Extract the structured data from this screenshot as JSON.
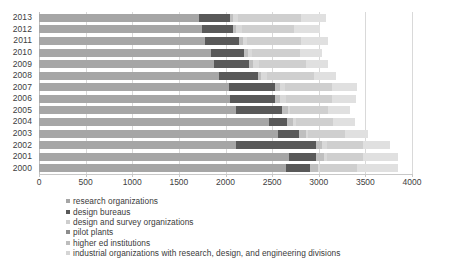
{
  "chart_data": {
    "type": "bar",
    "orientation": "horizontal",
    "stacked": true,
    "title": "",
    "xlabel": "",
    "ylabel": "",
    "xlim": [
      0,
      4000
    ],
    "xticks": [
      0,
      500,
      1000,
      1500,
      2000,
      2500,
      3000,
      3500,
      4000
    ],
    "grid": true,
    "legend_position": "bottom-left",
    "categories": [
      "2013",
      "2012",
      "2011",
      "2010",
      "2009",
      "2008",
      "2007",
      "2006",
      "2005",
      "2004",
      "2003",
      "2002",
      "2001",
      "2000"
    ],
    "series": [
      {
        "name": "research organizations",
        "color": "#a6a6a6",
        "values": [
          1719,
          1744,
          1782,
          1840,
          1878,
          1926,
          2036,
          2049,
          2115,
          2464,
          2564,
          2110,
          2677,
          2646
        ]
      },
      {
        "name": "design bureaus",
        "color": "#595959",
        "values": [
          331,
          338,
          364,
          362,
          377,
          418,
          497,
          482,
          489,
          194,
          228,
          865,
          289,
          257
        ]
      },
      {
        "name": "design and survey organizations",
        "color": "#bfbfbf",
        "values": [
          33,
          33,
          38,
          36,
          42,
          42,
          49,
          58,
          61,
          63,
          68,
          57,
          85,
          85
        ]
      },
      {
        "name": "pilot plants",
        "color": "#d9d9d9",
        "values": [
          53,
          60,
          49,
          47,
          57,
          58,
          60,
          58,
          30,
          31,
          28,
          55,
          33,
          30
        ]
      },
      {
        "name": "higher ed institutions",
        "color": "#cfcfcf",
        "values": [
          671,
          560,
          581,
          517,
          506,
          503,
          500,
          500,
          406,
          402,
          393,
          390,
          388,
          390
        ]
      },
      {
        "name": "industrial organizations with research, design, and engineering divisions",
        "color": "#e0e0e0",
        "values": [
          266,
          280,
          280,
          238,
          239,
          239,
          265,
          255,
          231,
          238,
          248,
          290,
          380,
          442
        ]
      }
    ],
    "totals": [
      3073,
      3015,
      3094,
      3040,
      3099,
      3186,
      3407,
      3402,
      3332,
      3392,
      3529,
      3767,
      3852,
      3850
    ]
  },
  "axes": {
    "x_tick_labels": [
      "0",
      "500",
      "1000",
      "1500",
      "2000",
      "2500",
      "3000",
      "3500",
      "4000"
    ],
    "y_tick_labels": [
      "2013",
      "2012",
      "2011",
      "2010",
      "2009",
      "2008",
      "2007",
      "2006",
      "2005",
      "2004",
      "2003",
      "2002",
      "2001",
      "2000"
    ]
  },
  "legend": {
    "items": [
      {
        "label": "research organizations",
        "color": "#a6a6a6"
      },
      {
        "label": "design bureaus",
        "color": "#595959"
      },
      {
        "label": "design and survey organizations",
        "color": "#cdcdcd"
      },
      {
        "label": "pilot plants",
        "color": "#8c8c8c"
      },
      {
        "label": "higher ed institutions",
        "color": "#bdbdbd"
      },
      {
        "label": "industrial organizations with research, design, and engineering divisions",
        "color": "#d5d5d5"
      }
    ]
  }
}
